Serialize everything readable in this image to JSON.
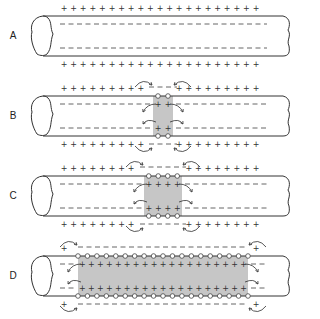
{
  "figure": {
    "panels": [
      {
        "label": "A",
        "description": "Resting axon: outside positive, inside negative",
        "active_zone": null
      },
      {
        "label": "B",
        "description": "Local depolarization with 2 open channels; local currents spread",
        "active_zone": {
          "channels": 2
        }
      },
      {
        "label": "C",
        "description": "Depolarized region spreads to 4 channels",
        "active_zone": {
          "channels": 4
        }
      },
      {
        "label": "D",
        "description": "Depolarization spreads along most of the axon",
        "active_zone": {
          "channels": 18
        }
      }
    ],
    "symbols": {
      "outside_positive": "+",
      "inside_negative": "−",
      "open_channel": "circle-icon",
      "local_current": "curved-arrow-icon"
    },
    "colors": {
      "depolarized_zone": "#c6c6c6",
      "line": "#333333",
      "background": "#ffffff"
    }
  }
}
